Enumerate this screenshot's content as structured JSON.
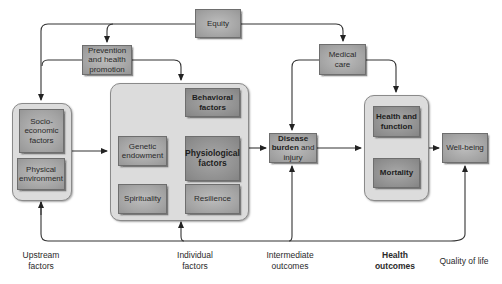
{
  "diagram": {
    "nodes": {
      "equity": "Equity",
      "prevention": "Prevention and health promotion",
      "prevention_lines": [
        "Prevention",
        "and health",
        "promotion"
      ],
      "medical_care_lines": [
        "Medical",
        "care"
      ],
      "socioeconomic_lines": [
        "Socio-",
        "economic",
        "factors"
      ],
      "physical_env_lines": [
        "Physical",
        "environment"
      ],
      "behavioral_lines": [
        "Behavioral",
        "factors"
      ],
      "genetic_lines": [
        "Genetic",
        "endowment"
      ],
      "physiological_lines": [
        "Physiological",
        "factors"
      ],
      "spirituality": "Spirituality",
      "resilience": "Resilience",
      "disease_bold_1": "Disease",
      "disease_bold_2": "burden",
      "disease_rest_2": " and",
      "disease_rest_3": "injury",
      "health_function_lines": [
        "Health and",
        "function"
      ],
      "mortality": "Mortality",
      "wellbeing": "Well-being"
    },
    "stage_labels": {
      "upstream": [
        "Upstream",
        "factors"
      ],
      "individual": [
        "Individual",
        "factors"
      ],
      "intermediate": [
        "Intermediate",
        "outcomes"
      ],
      "health_outcomes": [
        "Health",
        "outcomes"
      ],
      "quality": "Quality of life"
    },
    "colors": {
      "box_fill": "#a8a8a8",
      "container_fill": "#dcdcdc",
      "line": "#333333",
      "background": "#ffffff"
    }
  }
}
